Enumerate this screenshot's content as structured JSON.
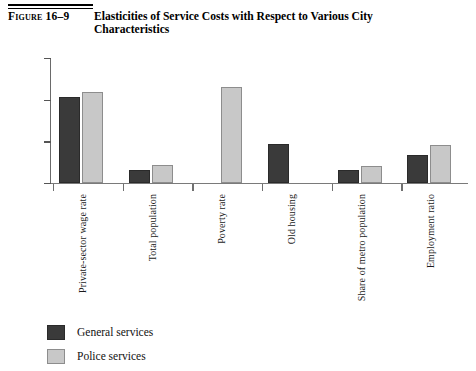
{
  "figure": {
    "number": "Figure 16–9",
    "title": "Elasticities of Service Costs with Respect to Various City Characteristics"
  },
  "legend": {
    "items": [
      {
        "label": "General services",
        "color": "#3a3a3a",
        "key": "general"
      },
      {
        "label": "Police services",
        "color": "#c8c8c8",
        "key": "police"
      }
    ]
  },
  "axis": {
    "y_ticks": [
      "0.00",
      "0.50",
      "1.00",
      "1.50"
    ]
  },
  "chart_data": {
    "type": "bar",
    "title": "Elasticities of Service Costs with Respect to Various City Characteristics",
    "xlabel": "",
    "ylabel": "",
    "ylim": [
      0,
      1.5
    ],
    "ytick_values": [
      0.0,
      0.5,
      1.0,
      1.5
    ],
    "ytick_labels": [
      "0.00",
      "0.50",
      "1.00",
      "1.50"
    ],
    "grid": false,
    "legend_position": "bottom-left",
    "categories": [
      "Private-sector wage rate",
      "Total population",
      "Poverty rate",
      "Old housing",
      "Share of metro population",
      "Employment ratio"
    ],
    "series": [
      {
        "name": "General services",
        "color": "#3a3a3a",
        "values": [
          1.03,
          0.16,
          null,
          0.47,
          0.16,
          0.34
        ]
      },
      {
        "name": "Police services",
        "color": "#c8c8c8",
        "values": [
          1.09,
          0.22,
          1.15,
          null,
          0.21,
          0.46
        ]
      }
    ]
  }
}
